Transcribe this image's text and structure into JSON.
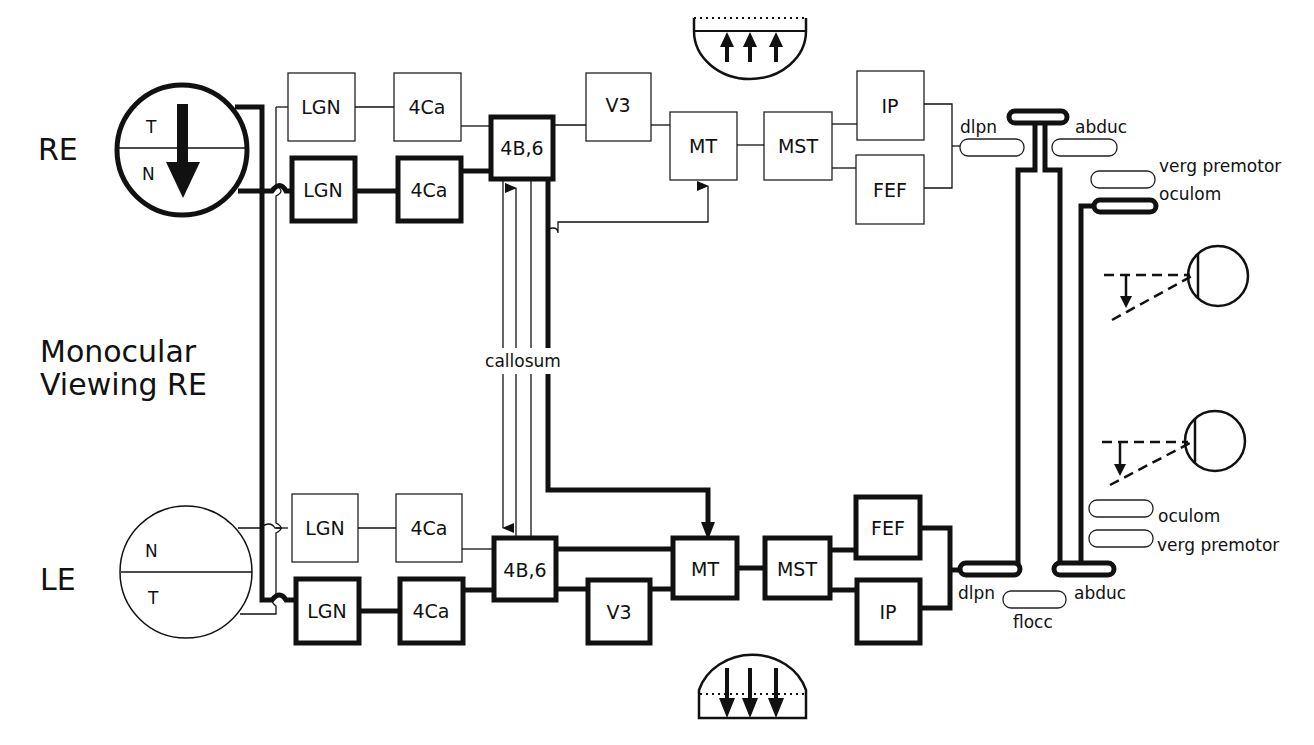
{
  "labels": {
    "re": "RE",
    "le": "LE",
    "mode_line1": "Monocular",
    "mode_line2": "Viewing RE",
    "callosum": "callosum"
  },
  "eyes": {
    "right": {
      "upper": "T",
      "lower": "N"
    },
    "left": {
      "upper": "N",
      "lower": "T"
    }
  },
  "top_pathway": {
    "lgn_thin": "LGN",
    "c4a_thin": "4Ca",
    "lgn_thick": "LGN",
    "c4a_thick": "4Ca",
    "b46": "4B,6",
    "v3": "V3",
    "mt": "MT",
    "mst": "MST",
    "ip": "IP",
    "fef": "FEF"
  },
  "bottom_pathway": {
    "lgn_thin": "LGN",
    "c4a_thin": "4Ca",
    "lgn_thick": "LGN",
    "c4a_thick": "4Ca",
    "b46": "4B,6",
    "v3": "V3",
    "mt": "MT",
    "mst": "MST",
    "fef": "FEF",
    "ip": "IP"
  },
  "brainstem_top": {
    "flocc": "flocc",
    "dlpn": "dlpn",
    "abduc": "abduc",
    "verg": "verg premotor",
    "oculom": "oculom"
  },
  "brainstem_bottom": {
    "oculom": "oculom",
    "verg": "verg premotor",
    "dlpn": "dlpn",
    "abduc": "abduc",
    "flocc": "flocc"
  }
}
